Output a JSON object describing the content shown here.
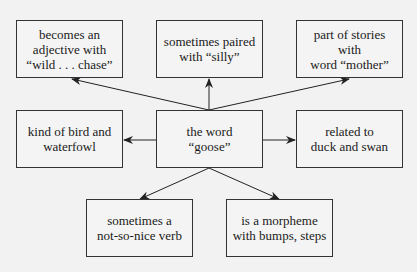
{
  "diagram": {
    "center": {
      "label": "the word\n“goose”"
    },
    "nodes": [
      {
        "id": "tl",
        "label": "becomes an\nadjective with\n“wild . . . chase”"
      },
      {
        "id": "tm",
        "label": "sometimes paired\nwith “silly”"
      },
      {
        "id": "tr",
        "label": "part of stories with\nword “mother”"
      },
      {
        "id": "ml",
        "label": "kind of bird and\nwaterfowl"
      },
      {
        "id": "mr",
        "label": "related to\nduck and swan"
      },
      {
        "id": "bl",
        "label": "sometimes a\nnot-so-nice verb"
      },
      {
        "id": "br",
        "label": "is a morpheme\nwith bumps, steps"
      }
    ],
    "edges": [
      {
        "from": "center",
        "to": "tl"
      },
      {
        "from": "center",
        "to": "tm"
      },
      {
        "from": "center",
        "to": "tr"
      },
      {
        "from": "center",
        "to": "ml"
      },
      {
        "from": "center",
        "to": "mr"
      },
      {
        "from": "center",
        "to": "bl"
      },
      {
        "from": "center",
        "to": "br"
      }
    ],
    "colors": {
      "line": "#222222",
      "background": "#f2f2f2"
    }
  }
}
